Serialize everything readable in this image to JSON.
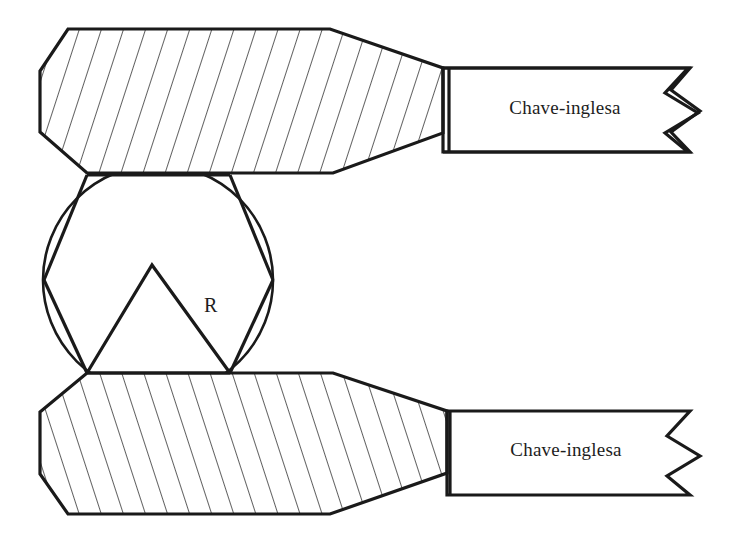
{
  "diagram": {
    "background_color": "#ffffff",
    "line_color": "#1a1a1a",
    "hatch_color": "#2b2b2b"
  },
  "labels": {
    "upper_handle": "Chave-inglesa",
    "lower_handle": "Chave-inglesa",
    "radius": "R"
  },
  "geometry": {
    "canvas": {
      "width": 738,
      "height": 539
    },
    "nut": {
      "shape": "hexagon-in-circle",
      "circle_center": [
        158,
        280
      ],
      "circle_radius": 115,
      "hexagon_vertices": [
        [
          44,
          280
        ],
        [
          87,
          175
        ],
        [
          230,
          175
        ],
        [
          273,
          280
        ],
        [
          230,
          373
        ],
        [
          87,
          373
        ]
      ],
      "inner_triangle_vertices": [
        [
          152,
          265
        ],
        [
          230,
          373
        ],
        [
          87,
          373
        ]
      ],
      "radius_label_position": [
        204,
        312
      ]
    },
    "upper_jaw": {
      "hatch_angle_deg": -72,
      "hatch_spacing": 21,
      "outline": [
        [
          68,
          29
        ],
        [
          330,
          29
        ],
        [
          443,
          68
        ],
        [
          443,
          133
        ],
        [
          333,
          173
        ],
        [
          87,
          173
        ],
        [
          40,
          132
        ],
        [
          40,
          71
        ]
      ]
    },
    "lower_jaw": {
      "hatch_angle_deg": 72,
      "hatch_spacing": 21,
      "outline": [
        [
          87,
          373
        ],
        [
          333,
          373
        ],
        [
          447,
          411
        ],
        [
          447,
          473
        ],
        [
          330,
          514
        ],
        [
          68,
          514
        ],
        [
          40,
          474
        ],
        [
          40,
          412
        ]
      ]
    },
    "upper_handle": {
      "divider_x": 449,
      "top_y": 68,
      "bottom_y": 133,
      "right_x": 700,
      "zigzag_peaks": 2,
      "text_position": [
        565,
        107
      ]
    },
    "lower_handle": {
      "divider_x": 450,
      "top_y": 411,
      "bottom_y": 473,
      "right_x": 702,
      "zigzag_peaks": 2,
      "text_position": [
        566,
        449
      ]
    }
  }
}
